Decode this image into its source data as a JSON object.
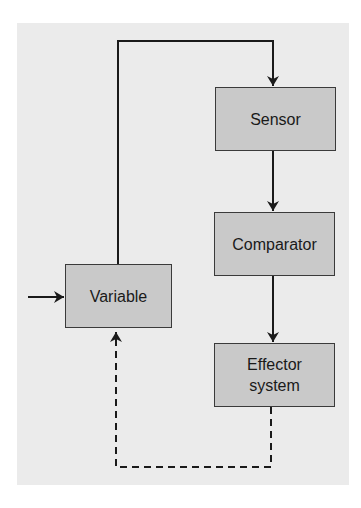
{
  "diagram": {
    "type": "feedback-loop",
    "colors": {
      "background": "#ffffff",
      "panel": "#ebebeb",
      "box_fill": "#c9c9c9",
      "box_border": "#3a3a3a",
      "line": "#1a1a1a",
      "text": "#1a1a1a"
    },
    "nodes": [
      {
        "id": "variable",
        "label": "Variable"
      },
      {
        "id": "sensor",
        "label": "Sensor"
      },
      {
        "id": "comparator",
        "label": "Comparator"
      },
      {
        "id": "effector",
        "label": "Effector system",
        "lines": [
          "Effector",
          "system"
        ]
      }
    ],
    "edges": [
      {
        "from": "external-input",
        "to": "variable",
        "style": "solid"
      },
      {
        "from": "variable",
        "to": "sensor",
        "style": "solid"
      },
      {
        "from": "sensor",
        "to": "comparator",
        "style": "solid"
      },
      {
        "from": "comparator",
        "to": "effector",
        "style": "solid"
      },
      {
        "from": "effector",
        "to": "variable",
        "style": "dashed"
      }
    ]
  }
}
